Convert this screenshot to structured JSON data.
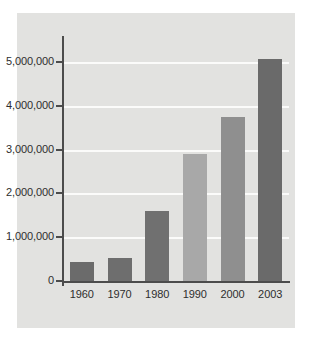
{
  "chart_data": {
    "type": "bar",
    "title": "",
    "subtitle": "",
    "xlabel": "",
    "ylabel": "",
    "categories": [
      "1960",
      "1970",
      "1980",
      "1990",
      "2000",
      "2003"
    ],
    "values": [
      440000,
      520000,
      1600000,
      2900000,
      3750000,
      5060000
    ],
    "ylim": [
      0,
      5500000
    ],
    "yticks": [
      0,
      1000000,
      2000000,
      3000000,
      4000000,
      5000000
    ],
    "ytick_labels": [
      "0",
      "1,000,000",
      "2,000,000",
      "3,000,000",
      "4,000,000",
      "5,000,000"
    ],
    "grid": true,
    "grid_color": "#fbfbfa",
    "legend": "none",
    "panel_color": "#e2e2e0",
    "axis_color": "#4c4c4c",
    "bar_colors": [
      "#6b6b6b",
      "#6e6e6e",
      "#707070",
      "#a8a8a8",
      "#8f8f8f",
      "#6a6a6a"
    ],
    "series": [
      {
        "name": "value",
        "values": [
          440000,
          520000,
          1600000,
          2900000,
          3750000,
          5060000
        ]
      }
    ]
  },
  "figure": {
    "caption": ""
  }
}
